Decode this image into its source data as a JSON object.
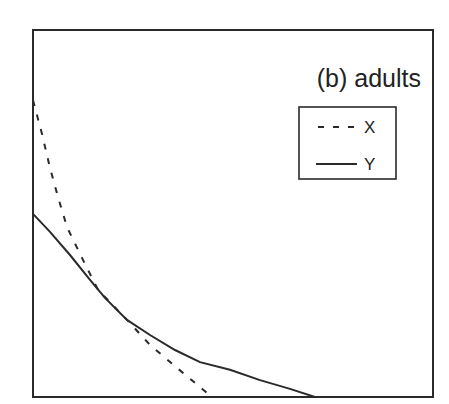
{
  "chart_data": {
    "type": "line",
    "title": "(b) adults",
    "xlabel": "",
    "ylabel": "",
    "xlim": [
      0,
      1
    ],
    "ylim": [
      0,
      1
    ],
    "grid": false,
    "ticks": "none",
    "legend_position": "upper right",
    "legend": [
      {
        "name": "X",
        "style": "dashed"
      },
      {
        "name": "Y",
        "style": "solid"
      }
    ],
    "series": [
      {
        "name": "X",
        "style": "dashed",
        "x": [
          0,
          0.0225,
          0.0425,
          0.0625,
          0.085,
          0.1225,
          0.1625,
          0.235,
          0.2925,
          0.355,
          0.4175,
          0.4475
        ],
        "y": [
          0.809,
          0.717,
          0.624,
          0.545,
          0.463,
          0.379,
          0.292,
          0.21,
          0.142,
          0.084,
          0.027,
          0
        ]
      },
      {
        "name": "Y",
        "style": "solid",
        "x": [
          0,
          0.0425,
          0.0925,
          0.1425,
          0.18,
          0.235,
          0.2925,
          0.355,
          0.4175,
          0.4925,
          0.5675,
          0.6425,
          0.705
        ],
        "y": [
          0.499,
          0.45,
          0.387,
          0.319,
          0.27,
          0.21,
          0.169,
          0.128,
          0.095,
          0.074,
          0.046,
          0.022,
          0
        ]
      }
    ]
  },
  "colors": {
    "line": "#2a2a2a",
    "background": "#ffffff"
  }
}
